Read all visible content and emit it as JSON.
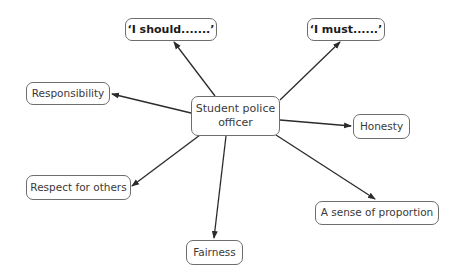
{
  "diagram": {
    "type": "spider-diagram",
    "center": {
      "label": "Student police officer"
    },
    "nodes": [
      {
        "id": "should",
        "label": "‘I should.......’",
        "bold": true
      },
      {
        "id": "must",
        "label": "‘I must......’",
        "bold": true
      },
      {
        "id": "responsibility",
        "label": "Responsibility",
        "bold": false
      },
      {
        "id": "honesty",
        "label": "Honesty",
        "bold": false
      },
      {
        "id": "respect",
        "label": "Respect for others",
        "bold": false
      },
      {
        "id": "proportion",
        "label": "A sense of proportion",
        "bold": false
      },
      {
        "id": "fairness",
        "label": "Fairness",
        "bold": false
      }
    ],
    "edges": [
      {
        "from": "center",
        "to": "should",
        "arrow": "end"
      },
      {
        "from": "center",
        "to": "must",
        "arrow": "end"
      },
      {
        "from": "center",
        "to": "responsibility",
        "arrow": "end"
      },
      {
        "from": "center",
        "to": "honesty",
        "arrow": "end"
      },
      {
        "from": "center",
        "to": "respect",
        "arrow": "end"
      },
      {
        "from": "center",
        "to": "proportion",
        "arrow": "end"
      },
      {
        "from": "center",
        "to": "fairness",
        "arrow": "end"
      }
    ],
    "colors": {
      "line": "#2b2b2b",
      "border": "#6e6e6e",
      "text": "#3a3a3a"
    }
  }
}
